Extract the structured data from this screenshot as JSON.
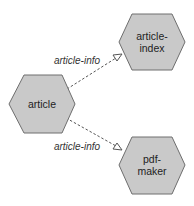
{
  "diagram": {
    "nodes": [
      {
        "id": "article",
        "lines": [
          "article"
        ]
      },
      {
        "id": "article-index",
        "lines": [
          "article-",
          "index"
        ]
      },
      {
        "id": "pdf-maker",
        "lines": [
          "pdf-",
          "maker"
        ]
      }
    ],
    "edges": [
      {
        "from": "article",
        "to": "article-index",
        "label": "article-info",
        "style": "dashed",
        "arrow": "open-triangle"
      },
      {
        "from": "article",
        "to": "pdf-maker",
        "label": "article-info",
        "style": "dashed",
        "arrow": "open-triangle"
      }
    ],
    "colors": {
      "node_fill": "#c9c9c9",
      "node_stroke": "#6e6e6e",
      "edge": "#555555"
    }
  }
}
